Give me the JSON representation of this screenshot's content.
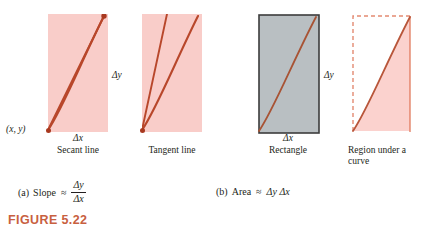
{
  "figure": {
    "number_label": "FIGURE 5.22"
  },
  "colors": {
    "pink_fill": "#f9cdc9",
    "pink_fill_light": "#fbd5d1",
    "curve_red": "#b8472b",
    "grey_fill": "#b9bfc2",
    "grey_border": "#3c3c3c",
    "dashed_border": "#e38a72",
    "figure_label": "#c8603f",
    "text": "#231f20"
  },
  "panels": [
    {
      "id": "secant",
      "caption": "Secant line",
      "delta_x_label": "Δx",
      "fill": "pink",
      "curve": "increasing-concave",
      "extra_line": "secant-chord",
      "point_label": "(x, y)"
    },
    {
      "id": "tangent",
      "caption": "Tangent line",
      "delta_x_label": "",
      "fill": "pink",
      "curve": "increasing-concave",
      "extra_line": "tangent-ray"
    },
    {
      "id": "rectangle",
      "caption": "Rectangle",
      "delta_x_label": "Δx",
      "fill": "grey",
      "curve": "increasing-concave"
    },
    {
      "id": "region",
      "caption": "Region under a curve",
      "delta_x_label": "",
      "fill": "pink-under-curve",
      "curve": "increasing-concave",
      "border": "dashed"
    }
  ],
  "labels": {
    "delta_y_left": "Δy",
    "delta_y_right": "Δy",
    "point_xy": "(x, y)"
  },
  "subcaptions": {
    "a": {
      "index": "(a)",
      "word": "Slope",
      "approx": "≈",
      "numerator": "Δy",
      "denominator": "Δx"
    },
    "b": {
      "index": "(b)",
      "word": "Area",
      "approx": "≈",
      "expression": "Δy Δx"
    }
  }
}
